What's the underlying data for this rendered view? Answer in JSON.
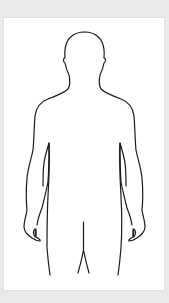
{
  "figure": {
    "label": "Human body outline (front view)",
    "view": "front",
    "stroke_color": "#1a1a1a",
    "panel_color": "#ffffff",
    "background_color": "#e9e9e9"
  }
}
